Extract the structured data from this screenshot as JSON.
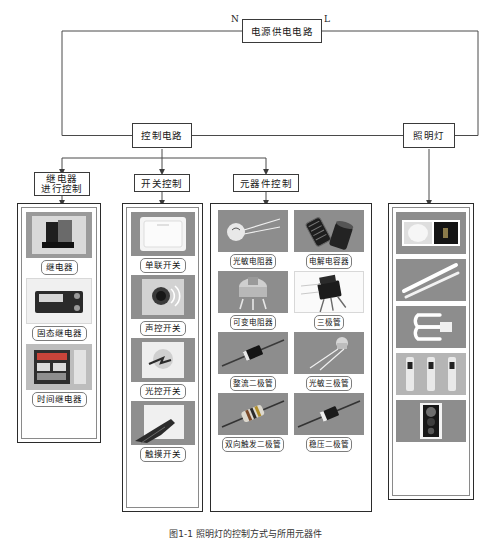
{
  "diagram": {
    "power_box": "电源供电电路",
    "wire_n": "N",
    "wire_l": "L",
    "control_box": "控制电路",
    "lamp_box": "照明灯",
    "branches": [
      {
        "id": "relay",
        "label_line1": "继电器",
        "label_line2": "进行控制"
      },
      {
        "id": "switch",
        "label_line1": "开关控制",
        "label_line2": ""
      },
      {
        "id": "component",
        "label_line1": "元器件控制",
        "label_line2": ""
      }
    ]
  },
  "columns": {
    "relay": {
      "title": "继电器进行控制",
      "items": [
        {
          "label": "继电器",
          "image": "relay-photo"
        },
        {
          "label": "固态继电器",
          "image": "solid-state-relay-photo"
        },
        {
          "label": "时间继电器",
          "image": "time-relay-photo"
        }
      ]
    },
    "switch": {
      "title": "开关控制",
      "items": [
        {
          "label": "单联开关",
          "image": "single-switch-photo"
        },
        {
          "label": "声控开关",
          "image": "sound-switch-photo"
        },
        {
          "label": "光控开关",
          "image": "light-switch-photo"
        },
        {
          "label": "触摸开关",
          "image": "touch-switch-photo"
        }
      ]
    },
    "component": {
      "title": "元器件控制",
      "items": [
        {
          "label": "光敏电阻器",
          "image": "photoresistor-photo"
        },
        {
          "label": "电解电容器",
          "image": "electrolytic-capacitor-photo"
        },
        {
          "label": "可变电阻器",
          "image": "variable-resistor-photo"
        },
        {
          "label": "三极管",
          "image": "transistor-photo"
        },
        {
          "label": "整流二极管",
          "image": "rectifier-diode-photo"
        },
        {
          "label": "光敏三极管",
          "image": "phototransistor-photo"
        },
        {
          "label": "双向触发二极管",
          "image": "diac-photo"
        },
        {
          "label": "稳压二极管",
          "image": "zener-diode-photo"
        }
      ]
    },
    "lamp": {
      "title": "照明灯",
      "items": [
        {
          "label": "",
          "image": "lamp-panel-photo"
        },
        {
          "label": "",
          "image": "fluorescent-tube-photo"
        },
        {
          "label": "",
          "image": "energy-saving-lamp-photo"
        },
        {
          "label": "",
          "image": "led-tube-row-photo"
        },
        {
          "label": "",
          "image": "traffic-light-photo"
        }
      ]
    }
  },
  "caption": "图1-1  照明灯的控制方式与所用元器件"
}
